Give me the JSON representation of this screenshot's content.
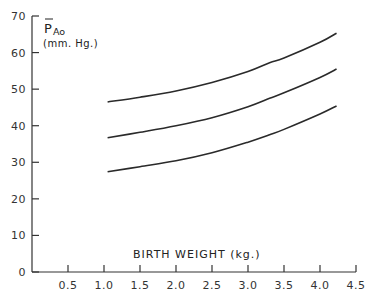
{
  "chart_data": {
    "type": "line",
    "title": "",
    "xlabel": "BIRTH WEIGHT (kg.)",
    "ylabel": {
      "symbol": "P",
      "subscript": "Ao",
      "overbar": true,
      "units": "(mm. Hg.)"
    },
    "xlim": [
      0,
      4.5
    ],
    "ylim": [
      0,
      70
    ],
    "x_ticks": [
      0.5,
      1.0,
      1.5,
      2.0,
      2.5,
      3.0,
      3.5,
      4.0,
      4.5
    ],
    "x_tick_labels": [
      "0.5",
      "1.0",
      "1.5",
      "2.0",
      "2.5",
      "3.0",
      "3.5",
      "4.0",
      "4.5"
    ],
    "y_ticks": [
      0,
      10,
      20,
      30,
      40,
      50,
      60,
      70
    ],
    "y_tick_labels": [
      "0",
      "10",
      "20",
      "30",
      "40",
      "50",
      "60",
      "70"
    ],
    "grid": false,
    "legend": "none",
    "series": [
      {
        "name": "upper",
        "x": [
          1.05,
          1.5,
          2.0,
          2.5,
          3.0,
          3.3,
          3.5,
          4.0,
          4.23
        ],
        "y": [
          46.5,
          47.8,
          49.5,
          51.8,
          54.8,
          57.2,
          58.5,
          62.8,
          65.3
        ]
      },
      {
        "name": "middle",
        "x": [
          1.05,
          1.5,
          2.0,
          2.5,
          3.0,
          3.3,
          3.5,
          4.0,
          4.23
        ],
        "y": [
          36.7,
          38.2,
          40.0,
          42.2,
          45.2,
          47.5,
          49.0,
          53.2,
          55.5
        ]
      },
      {
        "name": "lower",
        "x": [
          1.05,
          1.5,
          2.0,
          2.5,
          3.0,
          3.3,
          3.5,
          4.0,
          4.23
        ],
        "y": [
          27.4,
          28.8,
          30.4,
          32.6,
          35.5,
          37.5,
          39.0,
          43.2,
          45.4
        ]
      }
    ]
  }
}
